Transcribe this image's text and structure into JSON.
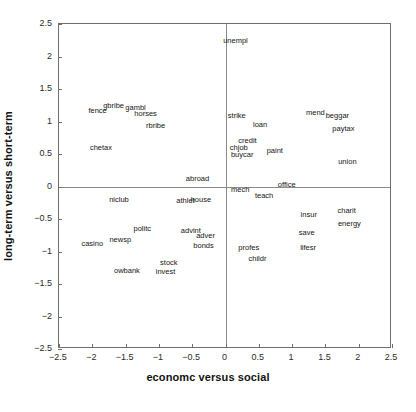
{
  "chart_data": {
    "type": "scatter",
    "title": "",
    "xlabel": "economc versus social",
    "ylabel": "long-term versus short-term",
    "xlim": [
      -2.5,
      2.5
    ],
    "ylim": [
      -2.5,
      2.5
    ],
    "grid": false,
    "legend": null,
    "xticks": [
      "-2.5",
      "-2",
      "-1.5",
      "-1",
      "-0.5",
      "0",
      "0.5",
      "1",
      "1.5",
      "2",
      "2.5"
    ],
    "xtick_values": [
      -2.5,
      -2,
      -1.5,
      -1,
      -0.5,
      0,
      0.5,
      1,
      1.5,
      2,
      2.5
    ],
    "yticks": [
      "2.5",
      "2",
      "1.5",
      "1",
      "0.5",
      "0",
      "-0.5",
      "-1",
      "-1.5",
      "-2",
      "-2.5"
    ],
    "ytick_values": [
      2.5,
      2,
      1.5,
      1,
      0.5,
      0,
      -0.5,
      -1,
      -1.5,
      -2,
      -2.5
    ],
    "reference_lines": [
      {
        "axis": "y",
        "value": 0
      },
      {
        "axis": "x",
        "value": 0
      }
    ],
    "marker": "text-label",
    "points": [
      {
        "label": "unempl",
        "x": 0.15,
        "y": 2.24
      },
      {
        "label": "gbribe",
        "x": -1.68,
        "y": 1.24
      },
      {
        "label": "fence",
        "x": -1.92,
        "y": 1.16
      },
      {
        "label": "gambl",
        "x": -1.35,
        "y": 1.21
      },
      {
        "label": "horses",
        "x": -1.2,
        "y": 1.11
      },
      {
        "label": "rbribe",
        "x": -1.05,
        "y": 0.93
      },
      {
        "label": "chetax",
        "x": -1.87,
        "y": 0.59
      },
      {
        "label": "strike",
        "x": 0.17,
        "y": 1.08
      },
      {
        "label": "mend",
        "x": 1.35,
        "y": 1.13
      },
      {
        "label": "beggar",
        "x": 1.68,
        "y": 1.09
      },
      {
        "label": "loan",
        "x": 0.52,
        "y": 0.95
      },
      {
        "label": "paytax",
        "x": 1.77,
        "y": 0.88
      },
      {
        "label": "credit",
        "x": 0.33,
        "y": 0.7
      },
      {
        "label": "chjob",
        "x": 0.2,
        "y": 0.6
      },
      {
        "label": "buycar",
        "x": 0.25,
        "y": 0.48
      },
      {
        "label": "paint",
        "x": 0.74,
        "y": 0.54
      },
      {
        "label": "union",
        "x": 1.83,
        "y": 0.38
      },
      {
        "label": "abroad",
        "x": -0.42,
        "y": 0.12
      },
      {
        "label": "office",
        "x": 0.92,
        "y": 0.02
      },
      {
        "label": "mech",
        "x": 0.22,
        "y": -0.06
      },
      {
        "label": "teach",
        "x": 0.58,
        "y": -0.15
      },
      {
        "label": "niclub",
        "x": -1.6,
        "y": -0.2
      },
      {
        "label": "athlet",
        "x": -0.6,
        "y": -0.23
      },
      {
        "label": "house",
        "x": -0.37,
        "y": -0.21
      },
      {
        "label": "insur",
        "x": 1.25,
        "y": -0.44
      },
      {
        "label": "charit",
        "x": 1.82,
        "y": -0.38
      },
      {
        "label": "energy",
        "x": 1.86,
        "y": -0.57
      },
      {
        "label": "politc",
        "x": -1.25,
        "y": -0.66
      },
      {
        "label": "advint",
        "x": -0.52,
        "y": -0.68
      },
      {
        "label": "adver",
        "x": -0.3,
        "y": -0.76
      },
      {
        "label": "save",
        "x": 1.22,
        "y": -0.72
      },
      {
        "label": "casino",
        "x": -2.0,
        "y": -0.88
      },
      {
        "label": "newsp",
        "x": -1.58,
        "y": -0.83
      },
      {
        "label": "bonds",
        "x": -0.33,
        "y": -0.92
      },
      {
        "label": "profes",
        "x": 0.35,
        "y": -0.95
      },
      {
        "label": "lifesr",
        "x": 1.24,
        "y": -0.95
      },
      {
        "label": "childr",
        "x": 0.48,
        "y": -1.12
      },
      {
        "label": "stock",
        "x": -0.85,
        "y": -1.17
      },
      {
        "label": "owbank",
        "x": -1.48,
        "y": -1.3
      },
      {
        "label": "invest",
        "x": -0.9,
        "y": -1.31
      }
    ]
  }
}
